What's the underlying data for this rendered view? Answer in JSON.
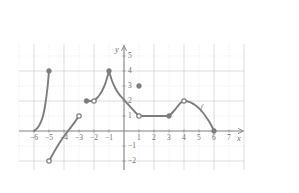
{
  "figure": {
    "axis_labels": {
      "x": "x",
      "y": "y"
    },
    "curve_label": "f",
    "colors": {
      "curve": "#7d7d7d",
      "axis": "#8f8f8f",
      "grid_major": "#cfcfcf",
      "grid_minor": "#dddddd",
      "text": "#6d6d6d",
      "background": "#ffffff"
    }
  },
  "chart_data": {
    "type": "line",
    "title": "",
    "xlabel": "x",
    "ylabel": "y",
    "xlim": [
      -7,
      8
    ],
    "ylim": [
      -2.6,
      5.8
    ],
    "xticks": [
      -6,
      -5,
      -4,
      -3,
      -2,
      -1,
      1,
      2,
      3,
      4,
      5,
      6,
      7
    ],
    "yticks": [
      5,
      4,
      3,
      2,
      1,
      -1,
      -2
    ],
    "xtick_labels": [
      "−6",
      "−5",
      "−4",
      "−3",
      "−2",
      "−1",
      "1",
      "2",
      "3",
      "4",
      "5",
      "6",
      "7"
    ],
    "ytick_labels": [
      "5",
      "4",
      "3",
      "2",
      "1",
      "−1",
      "−2"
    ],
    "grid": true,
    "grid_major_step": 2,
    "grid_minor_step": 1,
    "legend": "none",
    "annotations": [
      {
        "text": "f",
        "x": 5.1,
        "y": 1.55,
        "style": "italic"
      }
    ],
    "series": [
      {
        "name": "branch-1",
        "comment": "steeply increasing curve on [-6,-5]",
        "x": [
          -6.0,
          -5.85,
          -5.7,
          -5.55,
          -5.4,
          -5.25,
          -5.1,
          -5.0
        ],
        "y": [
          0.0,
          0.12,
          0.3,
          0.58,
          1.0,
          1.75,
          2.9,
          4.0
        ]
      },
      {
        "name": "branch-2",
        "comment": "increasing concave-down curve on (-5,-3)",
        "x": [
          -5.0,
          -4.75,
          -4.5,
          -4.25,
          -4.0,
          -3.75,
          -3.5,
          -3.25,
          -3.0
        ],
        "y": [
          -2.0,
          -1.55,
          -1.12,
          -0.72,
          -0.35,
          -0.02,
          0.3,
          0.64,
          1.0
        ]
      },
      {
        "name": "branch-3",
        "comment": "constant segment y=2 on [-2.5,-2)",
        "x": [
          -2.5,
          -2.0
        ],
        "y": [
          2.0,
          2.0
        ]
      },
      {
        "name": "branch-4",
        "comment": "increasing curve from (-2,2) to peak (-1,4)",
        "x": [
          -2.0,
          -1.8,
          -1.6,
          -1.4,
          -1.2,
          -1.0
        ],
        "y": [
          2.0,
          2.2,
          2.45,
          2.8,
          3.3,
          4.0
        ]
      },
      {
        "name": "branch-5",
        "comment": "decreasing convex curve from (-1,4) to (1,1)",
        "x": [
          -1.0,
          -0.8,
          -0.6,
          -0.4,
          -0.2,
          0.0,
          0.25,
          0.5,
          0.75,
          1.0
        ],
        "y": [
          4.0,
          3.35,
          2.9,
          2.55,
          2.3,
          2.08,
          1.8,
          1.52,
          1.25,
          1.0
        ]
      },
      {
        "name": "branch-6",
        "comment": "constant segment y=1 on [1,3]",
        "x": [
          1.0,
          3.0
        ],
        "y": [
          1.0,
          1.0
        ]
      },
      {
        "name": "branch-7",
        "comment": "hump rising from (3,1) to (4,2) then falling to (6,0)",
        "x": [
          3.0,
          3.25,
          3.5,
          3.75,
          4.0,
          4.4,
          4.8,
          5.2,
          5.6,
          5.85,
          6.0
        ],
        "y": [
          1.0,
          1.25,
          1.55,
          1.85,
          2.0,
          1.92,
          1.68,
          1.3,
          0.75,
          0.32,
          0.0
        ]
      }
    ],
    "closed_points": [
      {
        "x": -5,
        "y": 4
      },
      {
        "x": -2.5,
        "y": 2
      },
      {
        "x": -1,
        "y": 4
      },
      {
        "x": 1,
        "y": 3
      },
      {
        "x": 3,
        "y": 1
      },
      {
        "x": 6,
        "y": 0
      }
    ],
    "open_points": [
      {
        "x": -5,
        "y": -2
      },
      {
        "x": -3,
        "y": 1
      },
      {
        "x": -2,
        "y": 2
      },
      {
        "x": 1,
        "y": 1
      },
      {
        "x": 4,
        "y": 2
      }
    ],
    "isolated_points": [
      {
        "x": 1,
        "y": 3,
        "filled": true
      }
    ]
  }
}
